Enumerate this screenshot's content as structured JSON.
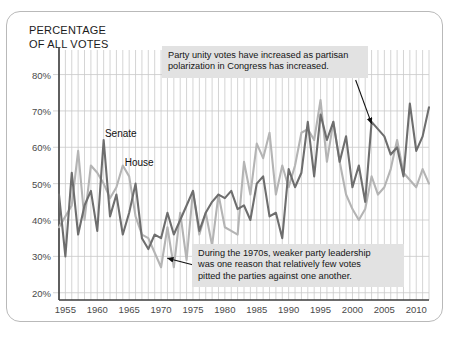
{
  "figure": {
    "axis_title": "PERCENTAGE\nOF ALL VOTES"
  },
  "colors": {
    "senate_line": "#6e6e6e",
    "house_line": "#b4b4b4",
    "gridline": "#c9c9c9",
    "axis": "#4a4a4a",
    "callout_bg": "#e2e2e2",
    "frame": "#b9b9b9"
  },
  "annotations": [
    {
      "name": "annotation-polarization",
      "text": "Party unity votes have increased as partisan\npolarization in Congress has increased."
    },
    {
      "name": "annotation-1970s",
      "text": "During the 1970s, weaker party leadership\nwas one reason that relatively few votes\npitted the parties against one another."
    }
  ],
  "series_labels": {
    "senate": "Senate",
    "house": "House"
  },
  "chart_data": {
    "type": "line",
    "title": "PERCENTAGE OF ALL VOTES",
    "xlabel": "",
    "ylabel": "PERCENTAGE OF ALL VOTES",
    "xlim": [
      1954,
      2012
    ],
    "ylim": [
      18,
      84
    ],
    "ytick_labels": [
      "20%",
      "30%",
      "40%",
      "50%",
      "60%",
      "70%",
      "80%"
    ],
    "yticks": [
      20,
      30,
      40,
      50,
      60,
      70,
      80
    ],
    "xtick_labels": [
      "1955",
      "1960",
      "1965",
      "1970",
      "1975",
      "1980",
      "1985",
      "1990",
      "1995",
      "2000",
      "2005",
      "2010"
    ],
    "xticks": [
      1955,
      1960,
      1965,
      1970,
      1975,
      1980,
      1985,
      1990,
      1995,
      2000,
      2005,
      2010
    ],
    "grid": "vertical-every-year-and-horizontal-at-yticks",
    "legend": "inline-labels-on-plot",
    "x": [
      1954,
      1955,
      1956,
      1957,
      1958,
      1959,
      1960,
      1961,
      1962,
      1963,
      1964,
      1965,
      1966,
      1967,
      1968,
      1969,
      1970,
      1971,
      1972,
      1973,
      1974,
      1975,
      1976,
      1977,
      1978,
      1979,
      1980,
      1981,
      1982,
      1983,
      1984,
      1985,
      1986,
      1987,
      1988,
      1989,
      1990,
      1991,
      1992,
      1993,
      1994,
      1995,
      1996,
      1997,
      1998,
      1999,
      2000,
      2001,
      2002,
      2003,
      2004,
      2005,
      2006,
      2007,
      2008,
      2009,
      2010,
      2011,
      2012
    ],
    "series": [
      {
        "name": "House",
        "color": "#b4b4b4",
        "values": [
          38,
          41,
          44,
          59,
          40,
          55,
          53,
          50,
          46,
          49,
          55,
          52,
          41,
          36,
          35,
          31,
          27,
          38,
          27,
          42,
          29,
          48,
          36,
          42,
          33,
          47,
          38,
          37,
          36,
          56,
          47,
          61,
          57,
          64,
          47,
          55,
          49,
          55,
          64,
          65,
          62,
          73,
          56,
          67,
          56,
          47,
          43,
          40,
          43,
          52,
          47,
          49,
          54,
          62,
          53,
          51,
          49,
          54,
          50
        ]
      },
      {
        "name": "Senate",
        "color": "#6e6e6e",
        "values": [
          47,
          30,
          53,
          36,
          44,
          48,
          37,
          62,
          41,
          47,
          36,
          42,
          50,
          35,
          32,
          36,
          35,
          42,
          36,
          40,
          44,
          48,
          37,
          42,
          45,
          47,
          46,
          48,
          43,
          44,
          40,
          50,
          52,
          41,
          42,
          35,
          54,
          49,
          53,
          67,
          52,
          69,
          62,
          67,
          56,
          63,
          49,
          55,
          45,
          67,
          65,
          63,
          58,
          60,
          52,
          72,
          59,
          63,
          71
        ]
      }
    ],
    "annotation_arrows": [
      {
        "name": "arrow-to-senate-2003",
        "from": [
          2000.5,
          78.5
        ],
        "to": [
          2003.0,
          66.5
        ]
      },
      {
        "name": "arrow-to-1970s-trough",
        "from": [
          1977.5,
          26.5
        ],
        "to": [
          1971.0,
          29.5
        ]
      }
    ]
  }
}
